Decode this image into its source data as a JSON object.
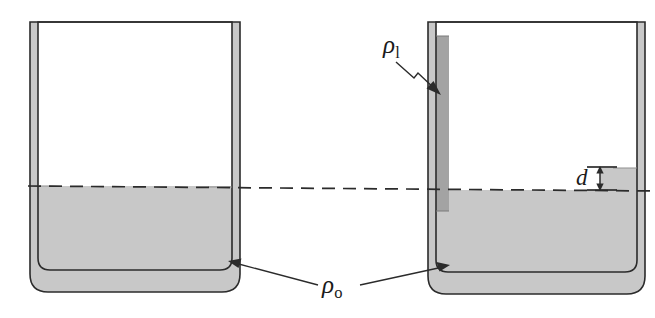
{
  "figure": {
    "kind": "physics-diagram",
    "labels": {
      "rho_l": {
        "symbol": "ρ",
        "subscript": "l",
        "meaning": "density of lighter/added liquid in left tube of right vessel"
      },
      "rho_o": {
        "symbol": "ρ",
        "subscript": "o",
        "meaning": "density of original liquid filling both vessels"
      },
      "d": {
        "symbol": "d",
        "meaning": "height difference between right-tube liquid surface and the reference dashed level"
      }
    },
    "colors": {
      "outline": "#2b2b2b",
      "liquid_o_fill": "#c8c8c8",
      "liquid_l_fill": "#a3a3a3",
      "background": "#ffffff",
      "dashed_line": "#2b2b2b",
      "label_text": "#1a1a1a"
    },
    "elements": {
      "left_vessel_name": "left U-tube vessel",
      "right_vessel_name": "right U-tube vessel",
      "dashed_reference_line_name": "equal-pressure reference level",
      "dimension_arrow_name": "height difference d"
    }
  }
}
